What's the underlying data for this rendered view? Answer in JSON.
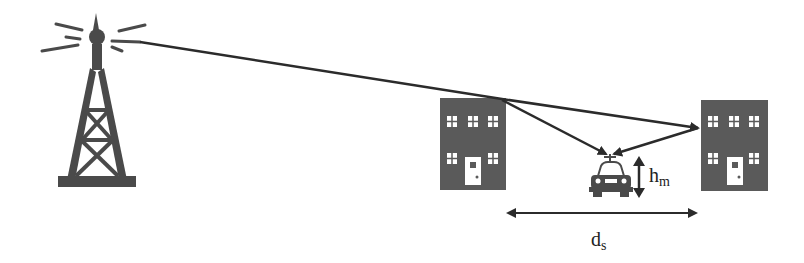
{
  "diagram": {
    "title": "",
    "elements": {
      "tower": {
        "label": "base-station-tower"
      },
      "building_left": {
        "label": "building"
      },
      "building_right": {
        "label": "building"
      },
      "car": {
        "label": "mobile-vehicle"
      }
    },
    "labels": {
      "height": {
        "main": "h",
        "sub": "m"
      },
      "distance": {
        "main": "d",
        "sub": "s"
      }
    },
    "colors": {
      "ink": "#2b2b2b",
      "building": "#5a5a5a",
      "window": "#ffffff"
    }
  }
}
